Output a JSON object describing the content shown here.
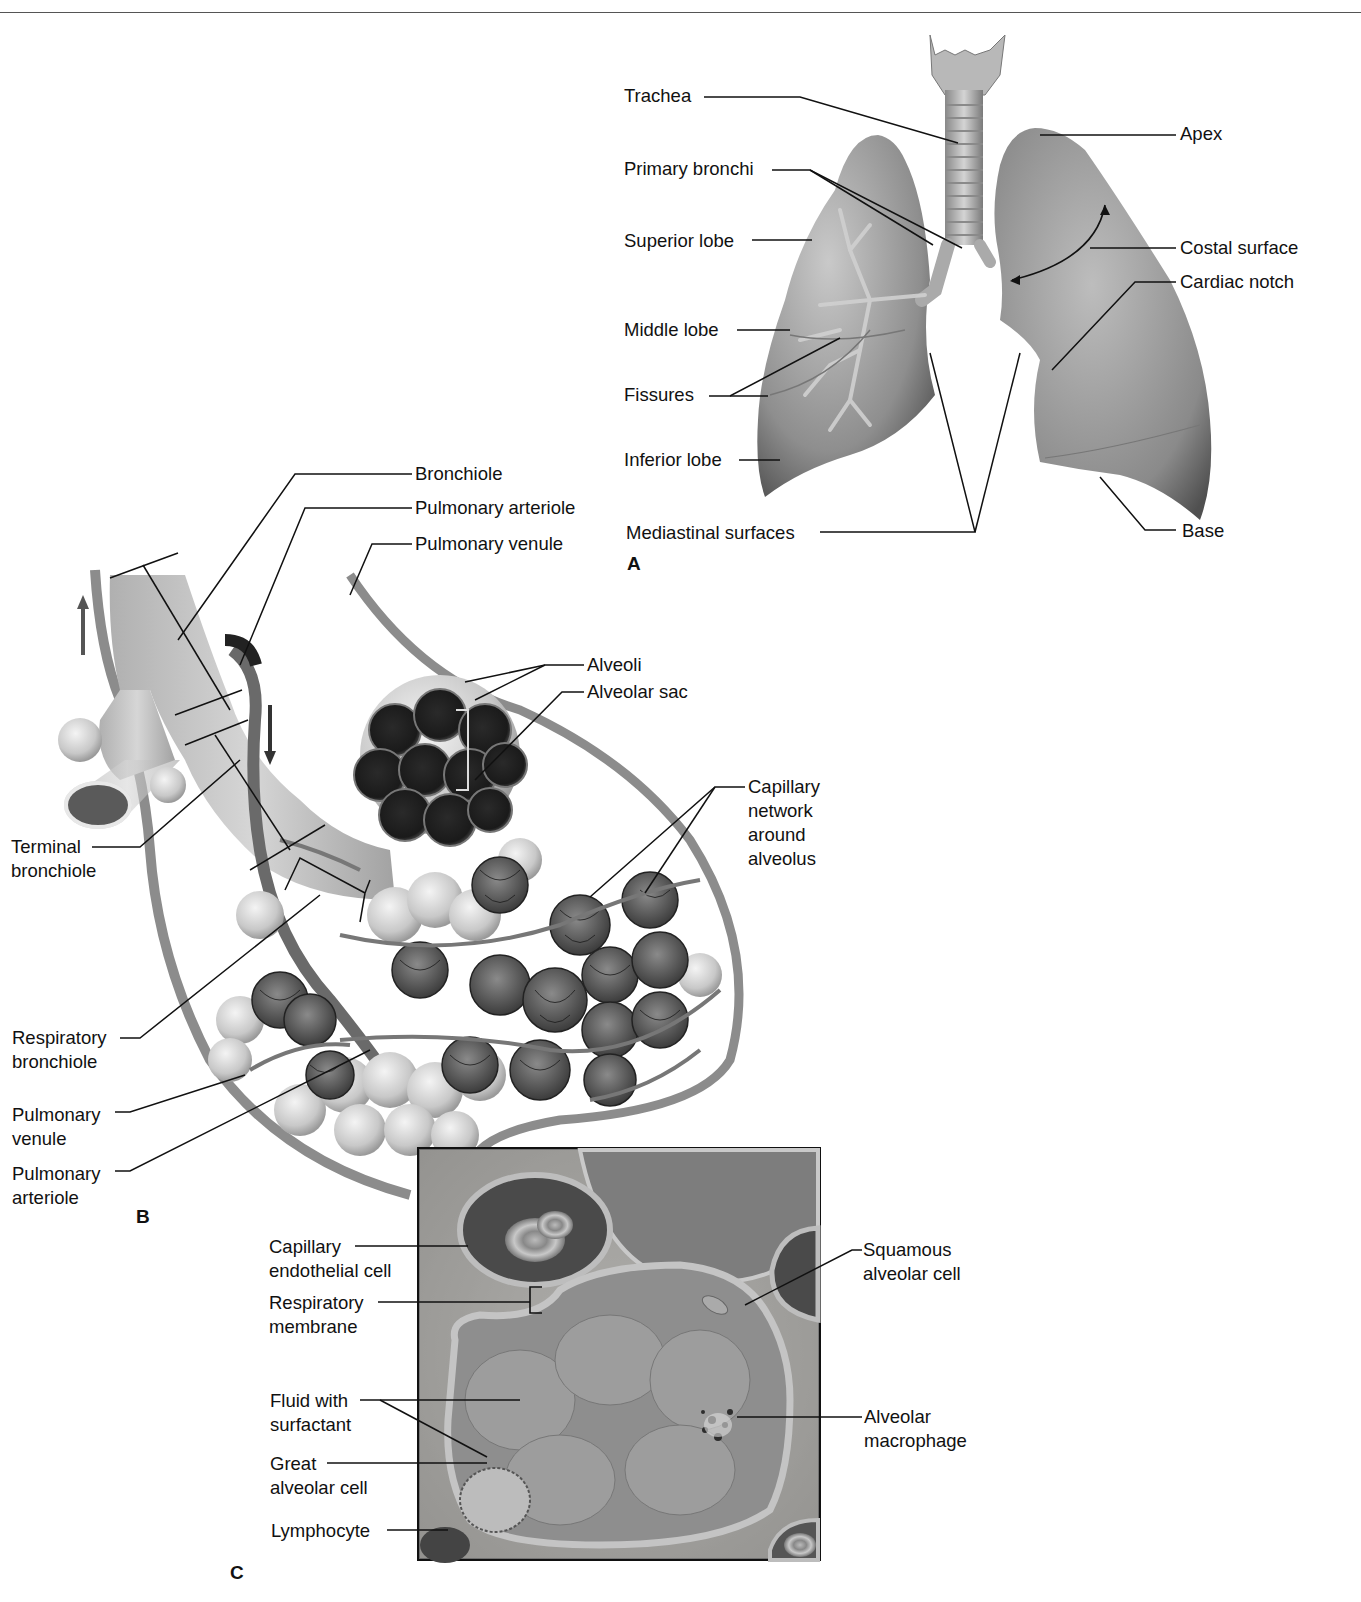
{
  "header": {
    "running_text": "",
    "rule": true
  },
  "panel_a": {
    "letter": "A",
    "labels": {
      "trachea": "Trachea",
      "primary_bronchi": "Primary bronchi",
      "superior_lobe": "Superior lobe",
      "middle_lobe": "Middle lobe",
      "fissures": "Fissures",
      "inferior_lobe": "Inferior lobe",
      "mediastinal_surfaces": "Mediastinal surfaces",
      "apex": "Apex",
      "costal_surface": "Costal surface",
      "cardiac_notch": "Cardiac notch",
      "base": "Base"
    }
  },
  "panel_b": {
    "letter": "B",
    "labels": {
      "bronchiole": "Bronchiole",
      "pulmonary_arteriole_top": "Pulmonary arteriole",
      "pulmonary_venule_top": "Pulmonary venule",
      "alveoli": "Alveoli",
      "alveolar_sac": "Alveolar sac",
      "capillary_network": "Capillary\nnetwork\naround\nalveolus",
      "terminal_bronchiole": "Terminal\nbronchiole",
      "respiratory_bronchiole": "Respiratory\nbronchiole",
      "pulmonary_venule_left": "Pulmonary\nvenule",
      "pulmonary_arteriole_left": "Pulmonary\narteriole"
    }
  },
  "panel_c": {
    "letter": "C",
    "labels": {
      "capillary_endothelial_cell": "Capillary\nendothelial cell",
      "respiratory_membrane": "Respiratory\nmembrane",
      "fluid_with_surfactant": "Fluid with\nsurfactant",
      "great_alveolar_cell": "Great\nalveolar cell",
      "lymphocyte": "Lymphocyte",
      "squamous_alveolar_cell": "Squamous\nalveolar cell",
      "alveolar_macrophage": "Alveolar\nmacrophage"
    }
  },
  "colors": {
    "line": "#111111",
    "tissue_light": "#d8d8d8",
    "tissue_mid": "#a0a0a0",
    "tissue_dark": "#3a3a3a"
  }
}
